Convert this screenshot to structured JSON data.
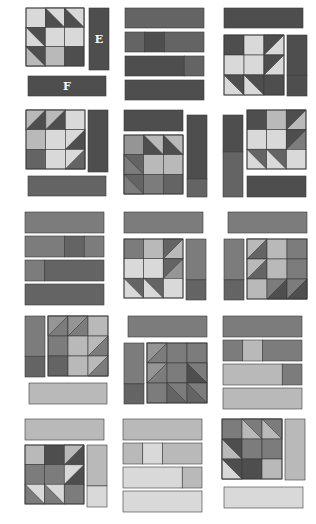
{
  "diagram": {
    "layout": {
      "columns": 3,
      "rows": 5
    },
    "palette": {
      "dark": "#4e4e4e",
      "darkmid": "#646464",
      "mid": "#7c7c7c",
      "midlight": "#959595",
      "light": "#b9b9b9",
      "pale": "#d9d9d9",
      "white": "#ffffff"
    },
    "labels": {
      "E": "E",
      "F": "F"
    },
    "panels": [
      {
        "id": "panel-1-1",
        "strips": [
          {
            "x": 89,
            "y": 8,
            "w": 20,
            "h": 62,
            "fill": "dark",
            "label": "E"
          },
          {
            "x": 28,
            "y": 76,
            "w": 78,
            "h": 20,
            "fill": "dark",
            "label": "F"
          }
        ],
        "blocks": [
          {
            "x": 26,
            "y": 8,
            "s": 58,
            "cells": [
              [
                "pale",
                "tri:dark:pale:tr",
                "tri:dark:pale:tr"
              ],
              [
                "tri:dark:pale:bl2",
                "pale",
                "pale"
              ],
              [
                "tri:dark:light:bl",
                "light",
                "dark"
              ]
            ]
          }
        ]
      },
      {
        "id": "panel-1-2",
        "strips": [
          {
            "x": 125,
            "y": 8,
            "w": 79,
            "h": 20,
            "fill": "darkmid"
          },
          {
            "x": 125,
            "y": 32,
            "w": 79,
            "h": 20,
            "segments": [
              {
                "frac": 0.25,
                "fill": "darkmid"
              },
              {
                "frac": 0.25,
                "fill": "dark"
              },
              {
                "frac": 0.5,
                "fill": "darkmid"
              }
            ]
          },
          {
            "x": 125,
            "y": 56,
            "w": 79,
            "h": 20,
            "segments": [
              {
                "frac": 0.75,
                "fill": "dark"
              },
              {
                "frac": 0.25,
                "fill": "darkmid"
              }
            ]
          },
          {
            "x": 125,
            "y": 80,
            "w": 79,
            "h": 20,
            "fill": "dark"
          }
        ],
        "blocks": []
      },
      {
        "id": "panel-1-3",
        "strips": [
          {
            "x": 224,
            "y": 8,
            "w": 79,
            "h": 20,
            "fill": "dark"
          },
          {
            "x": 287,
            "y": 35,
            "w": 20,
            "h": 61,
            "segments_v": [
              {
                "frac": 0.66,
                "fill": "dark"
              },
              {
                "frac": 0.34,
                "fill": "dark"
              }
            ]
          }
        ],
        "blocks": [
          {
            "x": 224,
            "y": 35,
            "s": 60,
            "cells": [
              [
                "dark",
                "pale",
                "tri:pale:dark:tl"
              ],
              [
                "pale",
                "pale",
                "tri:pale:dark:tl"
              ],
              [
                "tri:pale:dark:tr",
                "tri:pale:dark:tr",
                "dark"
              ]
            ]
          }
        ]
      },
      {
        "id": "panel-2-1",
        "strips": [
          {
            "x": 88,
            "y": 110,
            "w": 20,
            "h": 62,
            "fill": "dark"
          },
          {
            "x": 28,
            "y": 176,
            "w": 78,
            "h": 20,
            "fill": "darkmid"
          }
        ],
        "blocks": [
          {
            "x": 26,
            "y": 110,
            "s": 59,
            "cells": [
              [
                "tri:dark:light:tl",
                "tri:dark:light:tl",
                "pale"
              ],
              [
                "light",
                "pale",
                "tri:pale:dark:br"
              ],
              [
                "darkmid",
                "pale",
                "tri:pale:darkmid:br"
              ]
            ]
          }
        ]
      },
      {
        "id": "panel-2-2",
        "strips": [
          {
            "x": 124,
            "y": 110,
            "w": 59,
            "h": 21,
            "fill": "dark"
          },
          {
            "x": 187,
            "y": 115,
            "w": 20,
            "h": 82,
            "segments_v": [
              {
                "frac": 0.78,
                "fill": "dark"
              },
              {
                "frac": 0.22,
                "fill": "darkmid"
              }
            ]
          }
        ],
        "blocks": [
          {
            "x": 124,
            "y": 135,
            "s": 59,
            "cells": [
              [
                "midlight",
                "tri:dark:light:tr",
                "tri:dark:light:tr"
              ],
              [
                "tri:darkmid:mid:bl",
                "light",
                "light"
              ],
              [
                "tri:darkmid:mid:bl",
                "mid",
                "darkmid"
              ]
            ]
          }
        ]
      },
      {
        "id": "panel-2-3",
        "strips": [
          {
            "x": 223,
            "y": 115,
            "w": 20,
            "h": 82,
            "segments_v": [
              {
                "frac": 0.45,
                "fill": "dark"
              },
              {
                "frac": 0.55,
                "fill": "darkmid"
              }
            ]
          },
          {
            "x": 247,
            "y": 176,
            "w": 59,
            "h": 21,
            "fill": "dark"
          }
        ],
        "blocks": [
          {
            "x": 247,
            "y": 110,
            "s": 59,
            "cells": [
              [
                "dark",
                "light",
                "tri:light:dark:tl"
              ],
              [
                "pale",
                "pale",
                "tri:mid:dark:tl"
              ],
              [
                "tri:pale:darkmid:tr",
                "tri:pale:darkmid:tr",
                "pale"
              ]
            ]
          }
        ]
      },
      {
        "id": "panel-3-1",
        "strips": [
          {
            "x": 25,
            "y": 212,
            "w": 79,
            "h": 21,
            "fill": "mid"
          },
          {
            "x": 25,
            "y": 236,
            "w": 79,
            "h": 21,
            "segments": [
              {
                "frac": 0.5,
                "fill": "mid"
              },
              {
                "frac": 0.25,
                "fill": "darkmid"
              },
              {
                "frac": 0.25,
                "fill": "mid"
              }
            ]
          },
          {
            "x": 25,
            "y": 260,
            "w": 79,
            "h": 21,
            "segments": [
              {
                "frac": 0.25,
                "fill": "mid"
              },
              {
                "frac": 0.75,
                "fill": "darkmid"
              }
            ]
          },
          {
            "x": 25,
            "y": 284,
            "w": 79,
            "h": 21,
            "fill": "darkmid"
          }
        ],
        "blocks": []
      },
      {
        "id": "panel-3-2",
        "strips": [
          {
            "x": 124,
            "y": 212,
            "w": 79,
            "h": 21,
            "fill": "mid"
          },
          {
            "x": 186,
            "y": 239,
            "w": 20,
            "h": 61,
            "segments_v": [
              {
                "frac": 0.67,
                "fill": "mid"
              },
              {
                "frac": 0.33,
                "fill": "darkmid"
              }
            ]
          }
        ],
        "blocks": [
          {
            "x": 124,
            "y": 239,
            "s": 59,
            "cells": [
              [
                "mid",
                "light",
                "tri:light:darkmid:tl"
              ],
              [
                "pale",
                "pale",
                "tri:midlight:darkmid:tl"
              ],
              [
                "tri:pale:darkmid:tr",
                "tri:pale:darkmid:tr",
                "pale"
              ]
            ]
          }
        ]
      },
      {
        "id": "panel-3-3",
        "strips": [
          {
            "x": 228,
            "y": 212,
            "w": 79,
            "h": 21,
            "fill": "mid"
          },
          {
            "x": 224,
            "y": 239,
            "w": 20,
            "h": 61,
            "segments_v": [
              {
                "frac": 0.67,
                "fill": "mid"
              },
              {
                "frac": 0.33,
                "fill": "darkmid"
              }
            ]
          }
        ],
        "blocks": [
          {
            "x": 247,
            "y": 239,
            "s": 60,
            "cells": [
              [
                "tri:darkmid:light:tl2",
                "light",
                "mid"
              ],
              [
                "tri:darkmid:light:tl2",
                "light",
                "mid"
              ],
              [
                "light",
                "tri:mid:dark:br2",
                "tri:mid:dark:br2"
              ]
            ]
          }
        ]
      },
      {
        "id": "panel-4-1",
        "strips": [
          {
            "x": 25,
            "y": 316,
            "w": 20,
            "h": 61,
            "segments_v": [
              {
                "frac": 0.66,
                "fill": "mid"
              },
              {
                "frac": 0.34,
                "fill": "darkmid"
              }
            ]
          },
          {
            "x": 29,
            "y": 383,
            "w": 78,
            "h": 21,
            "fill": "light"
          }
        ],
        "blocks": [
          {
            "x": 48,
            "y": 316,
            "s": 60,
            "cells": [
              [
                "tri:mid:midlight:tl",
                "tri:mid:midlight:tl",
                "light"
              ],
              [
                "mid",
                "light",
                "tri:light:mid:br"
              ],
              [
                "darkmid",
                "light",
                "tri:light:mid:br"
              ]
            ]
          }
        ]
      },
      {
        "id": "panel-4-2",
        "strips": [
          {
            "x": 128,
            "y": 316,
            "w": 79,
            "h": 21,
            "fill": "mid"
          },
          {
            "x": 124,
            "y": 343,
            "w": 20,
            "h": 61,
            "segments_v": [
              {
                "frac": 0.67,
                "fill": "mid"
              },
              {
                "frac": 0.33,
                "fill": "darkmid"
              }
            ]
          }
        ],
        "blocks": [
          {
            "x": 147,
            "y": 343,
            "s": 60,
            "cells": [
              [
                "tri:mid:midlight:tl",
                "mid",
                "mid"
              ],
              [
                "tri:mid:midlight:tl",
                "mid",
                "tri:dark:mid:tr3"
              ],
              [
                "mid",
                "tri:darkmid:mid:tr3",
                "tri:darkmid:mid:tr3"
              ]
            ]
          }
        ]
      },
      {
        "id": "panel-4-3",
        "strips": [
          {
            "x": 223,
            "y": 316,
            "w": 79,
            "h": 21,
            "fill": "mid"
          },
          {
            "x": 223,
            "y": 340,
            "w": 79,
            "h": 21,
            "segments": [
              {
                "frac": 0.25,
                "fill": "mid"
              },
              {
                "frac": 0.25,
                "fill": "light"
              },
              {
                "frac": 0.5,
                "fill": "mid"
              }
            ]
          },
          {
            "x": 223,
            "y": 364,
            "w": 79,
            "h": 21,
            "segments": [
              {
                "frac": 0.75,
                "fill": "light"
              },
              {
                "frac": 0.25,
                "fill": "mid"
              }
            ]
          },
          {
            "x": 223,
            "y": 388,
            "w": 79,
            "h": 21,
            "fill": "light"
          }
        ],
        "blocks": []
      },
      {
        "id": "panel-5-1",
        "strips": [
          {
            "x": 25,
            "y": 419,
            "w": 79,
            "h": 21,
            "fill": "light"
          },
          {
            "x": 87,
            "y": 445,
            "w": 20,
            "h": 62,
            "segments_v": [
              {
                "frac": 0.66,
                "fill": "light"
              },
              {
                "frac": 0.34,
                "fill": "pale"
              }
            ]
          }
        ],
        "blocks": [
          {
            "x": 25,
            "y": 445,
            "s": 59,
            "cells": [
              [
                "light",
                "dark",
                "tri:dark:light:tl"
              ],
              [
                "mid",
                "mid",
                "tri:dark:pale:tl"
              ],
              [
                "tri:mid:pale:tr",
                "tri:mid:pale:tr",
                "mid"
              ]
            ]
          }
        ]
      },
      {
        "id": "panel-5-2",
        "strips": [
          {
            "x": 123,
            "y": 419,
            "w": 79,
            "h": 21,
            "fill": "light"
          },
          {
            "x": 123,
            "y": 443,
            "w": 79,
            "h": 21,
            "segments": [
              {
                "frac": 0.25,
                "fill": "light"
              },
              {
                "frac": 0.25,
                "fill": "pale"
              },
              {
                "frac": 0.5,
                "fill": "light"
              }
            ]
          },
          {
            "x": 123,
            "y": 467,
            "w": 79,
            "h": 21,
            "segments": [
              {
                "frac": 0.75,
                "fill": "pale"
              },
              {
                "frac": 0.25,
                "fill": "light"
              }
            ]
          },
          {
            "x": 123,
            "y": 491,
            "w": 79,
            "h": 21,
            "fill": "pale"
          }
        ],
        "blocks": []
      },
      {
        "id": "panel-5-3",
        "strips": [
          {
            "x": 285,
            "y": 419,
            "w": 20,
            "h": 61,
            "fill": "light"
          },
          {
            "x": 224,
            "y": 487,
            "w": 79,
            "h": 21,
            "fill": "pale"
          }
        ],
        "blocks": [
          {
            "x": 222,
            "y": 419,
            "s": 60,
            "cells": [
              [
                "mid",
                "tri:light:mid:tr4",
                "tri:light:mid:tr4"
              ],
              [
                "tri:dark:light:bl3",
                "mid",
                "mid"
              ],
              [
                "tri:dark:pale:bl3",
                "dark",
                "light"
              ]
            ]
          }
        ]
      }
    ]
  }
}
